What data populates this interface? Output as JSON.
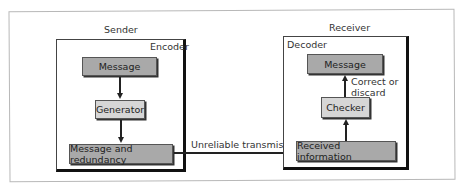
{
  "sender": {
    "title": "Sender",
    "group_label": "Encoder",
    "boxes": {
      "message": "Message",
      "generator": "Generator",
      "message_redundancy": "Message and redundancy"
    }
  },
  "receiver": {
    "title": "Receiver",
    "group_label": "Decoder",
    "boxes": {
      "message": "Message",
      "checker": "Checker",
      "received": "Received information"
    },
    "correct_label_line1": "Correct or",
    "correct_label_line2": "discard"
  },
  "channel": {
    "label": "Unreliable transmission"
  },
  "colors": {
    "dark_box": "#a9a9a9",
    "light_box": "#d6d6d6",
    "border": "#222222"
  }
}
